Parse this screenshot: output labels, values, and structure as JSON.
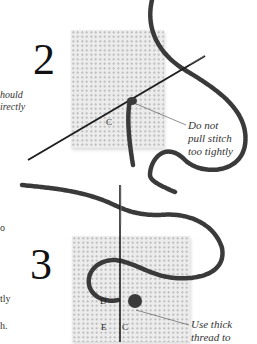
{
  "steps": [
    {
      "number": "2",
      "letters": [
        "C"
      ],
      "callout": [
        "Do not",
        "pull stitch",
        "too tightly"
      ]
    },
    {
      "number": "3",
      "letters": [
        "D",
        "E",
        "C"
      ],
      "callout": [
        "Use thick",
        "thread to"
      ]
    }
  ],
  "left_margin_text": {
    "top": [
      "hould",
      "irectly"
    ],
    "bottom": [
      "o",
      "tly",
      "h."
    ]
  },
  "colors": {
    "thread": "#3a3a3a",
    "canvas": "#ececec",
    "needle": "#222222"
  }
}
